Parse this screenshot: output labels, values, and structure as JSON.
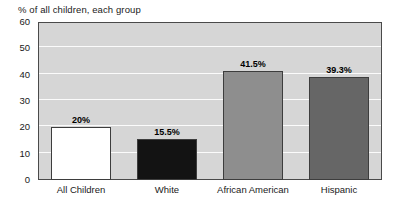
{
  "chart_data": {
    "type": "bar",
    "title": "% of all children, each group",
    "xlabel": "",
    "ylabel": "",
    "ylim": [
      0,
      60
    ],
    "yticks": [
      0,
      10,
      20,
      30,
      40,
      50,
      60
    ],
    "ytick_labels": [
      "0",
      "10",
      "20",
      "30",
      "40",
      "50",
      "60"
    ],
    "grid": true,
    "legend": "none",
    "categories": [
      "All Children",
      "White",
      "African American",
      "Hispanic"
    ],
    "values": [
      20,
      15.5,
      41.5,
      39.3
    ],
    "data_labels": [
      "20%",
      "15.5%",
      "41.5%",
      "39.3%"
    ],
    "bar_colors": [
      "#ffffff",
      "#131313",
      "#8e8e8e",
      "#666666"
    ],
    "bar_border_color": "#3d3d3d",
    "plot_background": "#d6d6d6",
    "gridline_color": "#fbfbfb",
    "axis_color": "#4a4a4a"
  }
}
